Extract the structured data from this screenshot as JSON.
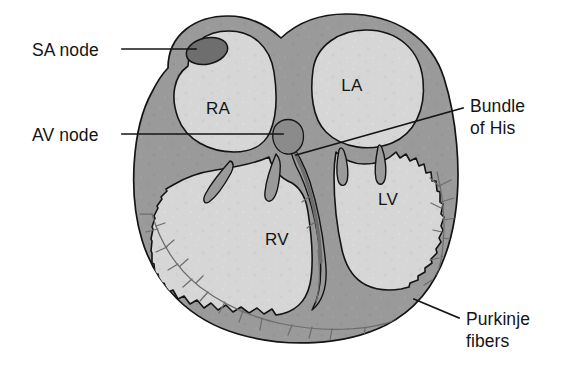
{
  "figure": {
    "background_color": "#ffffff"
  },
  "palette": {
    "myocardium": "#9a9a9a",
    "chamber_fill": "#d6d6d6",
    "septum": "#9a9a9a",
    "sa_node": "#6e6e6e",
    "av_node": "#8b8b8b",
    "outline": "#141414",
    "purkinje": "#6d6d6d",
    "label_text": "#141414"
  },
  "callouts": [
    {
      "id": "sa-node",
      "lines": [
        "SA node"
      ],
      "text": "SA node",
      "side": "left",
      "label_x": 32,
      "label_y": 56,
      "leader": "M 122 49 L 196 49"
    },
    {
      "id": "av-node",
      "lines": [
        "AV node"
      ],
      "text": "AV node",
      "side": "left",
      "label_x": 32,
      "label_y": 141,
      "leader": "M 122 134 L 283 134"
    },
    {
      "id": "bundle-of-his",
      "lines": [
        "Bundle",
        "of His"
      ],
      "text": "Bundle of His",
      "side": "right",
      "label_x": 470,
      "label_y": 112,
      "leader": "M 463 108 L 296 155"
    },
    {
      "id": "purkinje-fibers",
      "lines": [
        "Purkinje",
        "fibers"
      ],
      "text": "Purkinje fibers",
      "side": "right",
      "label_x": 466,
      "label_y": 325,
      "leader": "M 459 318 L 414 299"
    }
  ],
  "chambers": [
    {
      "id": "right-atrium",
      "abbr": "RA",
      "x": 218,
      "y": 114
    },
    {
      "id": "left-atrium",
      "abbr": "LA",
      "x": 352,
      "y": 91
    },
    {
      "id": "right-ventricle",
      "abbr": "RV",
      "x": 277,
      "y": 245
    },
    {
      "id": "left-ventricle",
      "abbr": "LV",
      "x": 388,
      "y": 205
    }
  ],
  "structures": [
    {
      "id": "sa-node-body",
      "name": "sinoatrial node",
      "shape": "ellipse",
      "cx": 207,
      "cy": 51,
      "rx": 21,
      "ry": 13,
      "rotation": -13
    },
    {
      "id": "av-node-body",
      "name": "atrioventricular node",
      "shape": "blob",
      "cx": 290,
      "cy": 137
    },
    {
      "id": "bundle-of-his-body",
      "name": "bundle of His",
      "shape": "band"
    },
    {
      "id": "purkinje-network",
      "name": "Purkinje fiber network",
      "shape": "branching"
    },
    {
      "id": "tricuspid-valve",
      "name": "tricuspid valve leaflets",
      "shape": "leaflets"
    },
    {
      "id": "mitral-valve",
      "name": "mitral valve leaflets",
      "shape": "leaflets"
    }
  ]
}
